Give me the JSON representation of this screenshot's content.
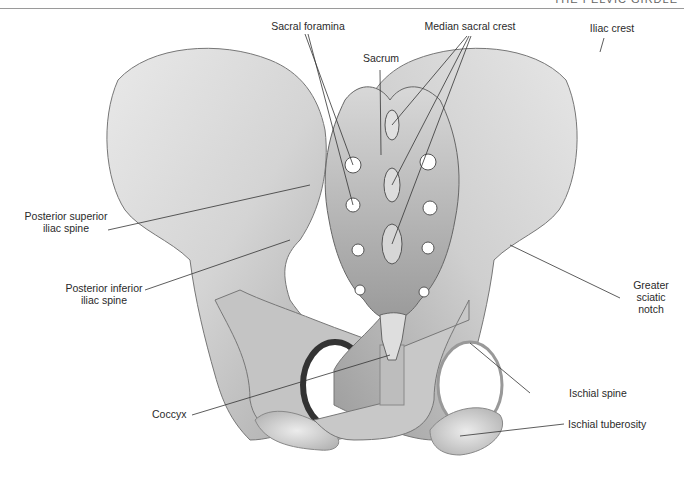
{
  "header": {
    "title": "THE PELVIC GIRDLE"
  },
  "figure": {
    "colors": {
      "bone_light": "#f2f2f2",
      "bone_mid": "#c9c9c9",
      "bone_dark": "#6e6e6e",
      "leader_line": "#333333",
      "foramen": "#ffffff"
    }
  },
  "labels": {
    "sacral_foramina": "Sacral foramina",
    "median_sacral_crest": "Median sacral crest",
    "iliac_crest": "Iliac crest",
    "sacrum": "Sacrum",
    "posterior_superior_iliac_spine_1": "Posterior superior",
    "posterior_superior_iliac_spine_2": "iliac spine",
    "posterior_inferior_iliac_spine_1": "Posterior inferior",
    "posterior_inferior_iliac_spine_2": "iliac spine",
    "greater_sciatic_notch_1": "Greater",
    "greater_sciatic_notch_2": "sciatic",
    "greater_sciatic_notch_3": "notch",
    "ischial_spine": "Ischial spine",
    "coccyx": "Coccyx",
    "ischial_tuberosity": "Ischial tuberosity"
  }
}
